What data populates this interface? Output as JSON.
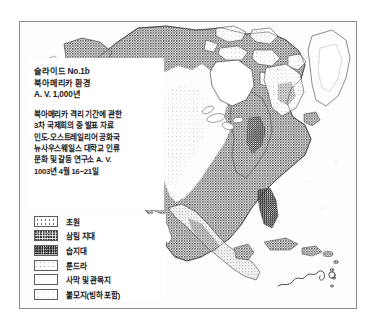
{
  "document": {
    "type": "scanned-slide-map",
    "frame_border_color": "#8a8a8a",
    "paper_color": "#ffffff",
    "ink_color": "#1b1b1b"
  },
  "caption": {
    "title_lines": [
      "슬라이드 No.1b",
      "북아메리카 환경",
      "A. V. 1,000년"
    ],
    "body_lines": [
      "북아메리카 격리 기간에 관한",
      "3차 국제회의 중 발표 자료",
      "인도-오스트레일리어 공화국",
      "뉴사우스웨일스 대학교 인류",
      "문화 및 갈등 연구소 A. V.",
      "1003년 4월 16~21일"
    ]
  },
  "legend": {
    "items": [
      {
        "label": "초원",
        "pattern": "grass",
        "swatch_tone": "#6a6a6a"
      },
      {
        "label": "삼림 지대",
        "pattern": "forest",
        "swatch_tone": "#3a3a3a"
      },
      {
        "label": "습지대",
        "pattern": "wetland",
        "swatch_tone": "#222222"
      },
      {
        "label": "툰드라",
        "pattern": "tundra",
        "swatch_tone": "#8c8c8c"
      },
      {
        "label": "사막 및 관목지",
        "pattern": "desert",
        "swatch_tone": "#ffffff"
      },
      {
        "label": "불모지(빙하 포함)",
        "pattern": "barren",
        "swatch_tone": "#bdbdbd"
      }
    ]
  },
  "map": {
    "subject": "North America vegetation zones",
    "signature_present": true,
    "coastline_ink": "#3a3a3a"
  }
}
